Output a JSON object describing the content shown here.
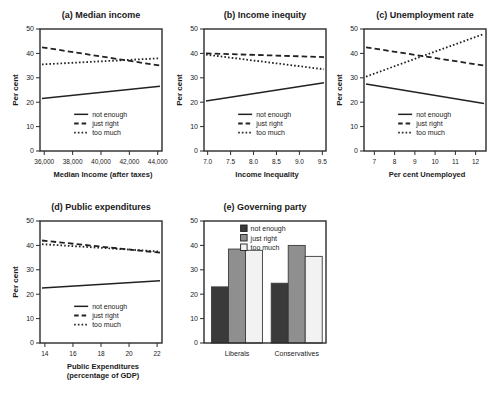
{
  "figure_title": "",
  "colors": {
    "line": "#222222",
    "axis": "#2b2b2b",
    "text": "#1a1a1a",
    "bar_dark": "#3a3a3a",
    "bar_gray": "#8f8f8f",
    "bar_light": "#f2f2f2",
    "bar_border": "#3a3a3a",
    "background": "#ffffff"
  },
  "chart_data": [
    {
      "id": "a",
      "type": "line",
      "title": "(a) Median income",
      "ylabel": "Per cent",
      "xlabel": "Median Income (after taxes)",
      "xlabel2": "",
      "ylim": [
        0,
        50
      ],
      "yticks": [
        0,
        10,
        20,
        30,
        40,
        50
      ],
      "xticks": [
        "36,000",
        "38,000",
        "40,000",
        "42,000",
        "44,000"
      ],
      "xtick_inset": 0.035,
      "legend_pos": "bottom",
      "series": [
        {
          "name": "not enough",
          "style": "solid",
          "endpoints": [
            21.5,
            26.5
          ]
        },
        {
          "name": "just right",
          "style": "dashed",
          "endpoints": [
            42.5,
            35
          ]
        },
        {
          "name": "too much",
          "style": "dotted",
          "endpoints": [
            35.5,
            38
          ]
        }
      ]
    },
    {
      "id": "b",
      "type": "line",
      "title": "(b) Income inequity",
      "ylabel": "Per cent",
      "xlabel": "Income Inequality",
      "xlabel2": "",
      "ylim": [
        0,
        50
      ],
      "yticks": [
        0,
        10,
        20,
        30,
        40,
        50
      ],
      "xticks": [
        "7.0",
        "7.5",
        "8.0",
        "8.5",
        "9.0",
        "9.5"
      ],
      "xtick_inset": 0.03,
      "legend_pos": "bottom",
      "series": [
        {
          "name": "not enough",
          "style": "solid",
          "endpoints": [
            20.5,
            28
          ]
        },
        {
          "name": "just right",
          "style": "dashed",
          "endpoints": [
            40,
            38.5
          ]
        },
        {
          "name": "too much",
          "style": "dotted",
          "endpoints": [
            39.5,
            33.5
          ]
        }
      ]
    },
    {
      "id": "c",
      "type": "line",
      "title": "(c) Unemployment rate",
      "ylabel": "Per cent",
      "xlabel": "Per cent Unemployed",
      "xlabel2": "",
      "ylim": [
        0,
        50
      ],
      "yticks": [
        0,
        10,
        20,
        30,
        40,
        50
      ],
      "xticks": [
        "7",
        "8",
        "9",
        "10",
        "11",
        "12"
      ],
      "xtick_inset": 0.085,
      "legend_pos": "bottom",
      "series": [
        {
          "name": "not enough",
          "style": "solid",
          "endpoints": [
            27.5,
            19.5
          ]
        },
        {
          "name": "just right",
          "style": "dashed",
          "endpoints": [
            42.5,
            35
          ]
        },
        {
          "name": "too much",
          "style": "dotted",
          "endpoints": [
            30.5,
            48
          ]
        }
      ]
    },
    {
      "id": "d",
      "type": "line",
      "title": "(d) Public expenditures",
      "ylabel": "Per cent",
      "xlabel": "Public Expenditures",
      "xlabel2": "(percentage of GDP)",
      "ylim": [
        0,
        50
      ],
      "yticks": [
        0,
        10,
        20,
        30,
        40,
        50
      ],
      "xticks": [
        "14",
        "16",
        "18",
        "20",
        "22"
      ],
      "xtick_inset": 0.04,
      "legend_pos": "bottom",
      "series": [
        {
          "name": "not enough",
          "style": "solid",
          "endpoints": [
            22.5,
            25.5
          ]
        },
        {
          "name": "just right",
          "style": "dashed",
          "endpoints": [
            42,
            37
          ]
        },
        {
          "name": "too much",
          "style": "dotted",
          "endpoints": [
            40.5,
            37.5
          ]
        }
      ]
    },
    {
      "id": "e",
      "type": "bar",
      "title": "(e) Governing party",
      "ylabel": "",
      "xlabel": "",
      "xlabel2": "",
      "ylim": [
        0,
        50
      ],
      "yticks": [
        0,
        10,
        20,
        30,
        40,
        50
      ],
      "categories": [
        "Liberals",
        "Conservatives"
      ],
      "legend_pos": "top",
      "series": [
        {
          "name": "not enough",
          "color": "#3a3a3a",
          "values": [
            23,
            24.5
          ]
        },
        {
          "name": "just right",
          "color": "#8f8f8f",
          "values": [
            38.5,
            40
          ]
        },
        {
          "name": "too much",
          "color": "#f2f2f2",
          "values": [
            38,
            35.5
          ]
        }
      ]
    }
  ]
}
